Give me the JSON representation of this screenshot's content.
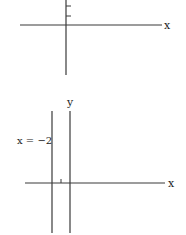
{
  "diagrams": [
    {
      "id": "top-graph",
      "x_axis_label": "x",
      "y_axis_label": "",
      "y_ticks_visible": 2
    },
    {
      "id": "bottom-graph",
      "x_axis_label": "x",
      "y_axis_label": "y",
      "line": {
        "label": "x = −2",
        "x_value": -2,
        "orientation": "vertical"
      },
      "x_ticks": [
        -1
      ]
    }
  ],
  "colors": {
    "ink": "#3a3a3a",
    "background": "#ffffff"
  }
}
